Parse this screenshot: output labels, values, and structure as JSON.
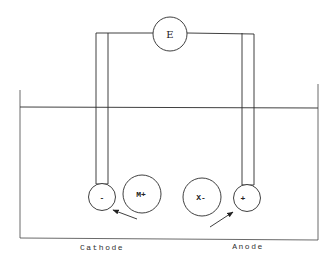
{
  "diagram": {
    "meter": {
      "label": "E"
    },
    "electrodes": {
      "cathode": {
        "sign": "-",
        "caption": "Cathode"
      },
      "anode": {
        "sign": "+",
        "caption": "Anode"
      }
    },
    "ions": {
      "cation": {
        "label": "M+",
        "moves_toward": "cathode"
      },
      "anion": {
        "label": "X-",
        "moves_toward": "anode"
      }
    },
    "colors": {
      "line": "#2a2a2a",
      "background": "#ffffff"
    }
  }
}
